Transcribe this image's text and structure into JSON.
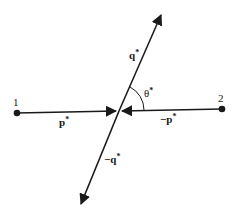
{
  "diagram": {
    "colors": {
      "ink": "#1a1a1a",
      "background": "#ffffff"
    },
    "points": [
      {
        "id": "particle-1",
        "label": "1",
        "x": 17,
        "y": 113
      },
      {
        "id": "particle-2",
        "label": "2",
        "x": 222,
        "y": 109
      }
    ],
    "center": {
      "x": 119,
      "y": 111
    },
    "vectors": [
      {
        "id": "p-star",
        "label": "p*",
        "from": [
          17,
          113
        ],
        "to": [
          116,
          111
        ]
      },
      {
        "id": "minus-p-star",
        "label": "−p*",
        "from": [
          222,
          109
        ],
        "to": [
          122,
          111
        ]
      },
      {
        "id": "q-star",
        "label": "q*",
        "from": [
          119,
          111
        ],
        "to": [
          161,
          15
        ]
      },
      {
        "id": "minus-q-star",
        "label": "−q*",
        "from": [
          119,
          111
        ],
        "to": [
          80,
          205
        ]
      }
    ],
    "labels": {
      "point1": "1",
      "point2": "2",
      "p": "p",
      "minus_p": "−p",
      "q": "q",
      "minus_q": "−q",
      "star": "*",
      "theta": "θ",
      "theta_star": "*"
    },
    "angle": {
      "label": "θ*",
      "between": [
        "q-star",
        "minus-p-star"
      ]
    }
  }
}
